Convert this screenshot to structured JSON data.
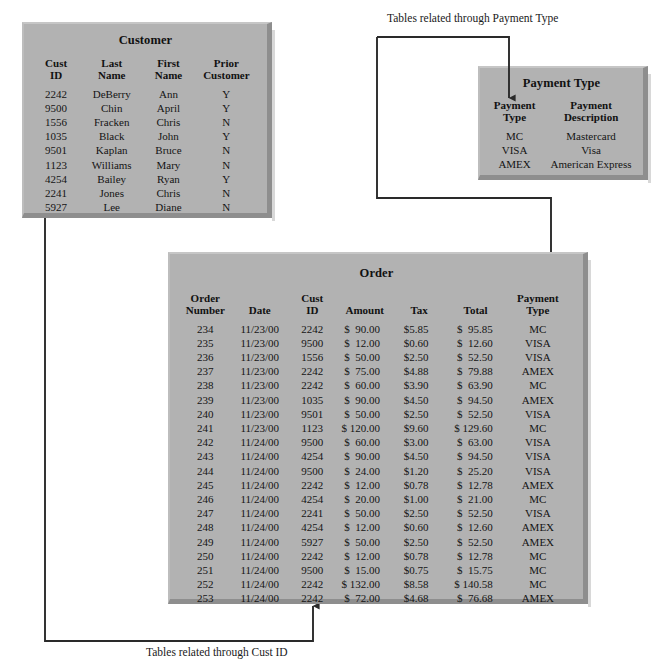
{
  "diagram": {
    "panel_color": "#b2b2b2",
    "line_color": "#2a2a2a"
  },
  "annotations": {
    "payment_link": "Tables related through Payment Type",
    "cust_link": "Tables related through Cust ID"
  },
  "customer": {
    "title": "Customer",
    "columns": [
      "Cust\nID",
      "Last\nName",
      "First\nName",
      "Prior\nCustomer"
    ],
    "rows": [
      [
        "2242",
        "DeBerry",
        "Ann",
        "Y"
      ],
      [
        "9500",
        "Chin",
        "April",
        "Y"
      ],
      [
        "1556",
        "Fracken",
        "Chris",
        "N"
      ],
      [
        "1035",
        "Black",
        "John",
        "Y"
      ],
      [
        "9501",
        "Kaplan",
        "Bruce",
        "N"
      ],
      [
        "1123",
        "Williams",
        "Mary",
        "N"
      ],
      [
        "4254",
        "Bailey",
        "Ryan",
        "Y"
      ],
      [
        "2241",
        "Jones",
        "Chris",
        "N"
      ],
      [
        "5927",
        "Lee",
        "Diane",
        "N"
      ]
    ]
  },
  "payment_type": {
    "title": "Payment Type",
    "columns": [
      "Payment\nType",
      "Payment\nDescription"
    ],
    "rows": [
      [
        "MC",
        "Mastercard"
      ],
      [
        "VISA",
        "Visa"
      ],
      [
        "AMEX",
        "American Express"
      ]
    ]
  },
  "order": {
    "title": "Order",
    "columns": [
      "Order\nNumber",
      "Date",
      "Cust\nID",
      "Amount",
      "Tax",
      "Total",
      "Payment\nType"
    ],
    "rows": [
      [
        "234",
        "11/23/00",
        "2242",
        "$  90.00",
        "$5.85",
        "$  95.85",
        "MC"
      ],
      [
        "235",
        "11/23/00",
        "9500",
        "$  12.00",
        "$0.60",
        "$  12.60",
        "VISA"
      ],
      [
        "236",
        "11/23/00",
        "1556",
        "$  50.00",
        "$2.50",
        "$  52.50",
        "VISA"
      ],
      [
        "237",
        "11/23/00",
        "2242",
        "$  75.00",
        "$4.88",
        "$  79.88",
        "AMEX"
      ],
      [
        "238",
        "11/23/00",
        "2242",
        "$  60.00",
        "$3.90",
        "$  63.90",
        "MC"
      ],
      [
        "239",
        "11/23/00",
        "1035",
        "$  90.00",
        "$4.50",
        "$  94.50",
        "AMEX"
      ],
      [
        "240",
        "11/23/00",
        "9501",
        "$  50.00",
        "$2.50",
        "$  52.50",
        "VISA"
      ],
      [
        "241",
        "11/23/00",
        "1123",
        "$ 120.00",
        "$9.60",
        "$ 129.60",
        "MC"
      ],
      [
        "242",
        "11/24/00",
        "9500",
        "$  60.00",
        "$3.00",
        "$  63.00",
        "VISA"
      ],
      [
        "243",
        "11/24/00",
        "4254",
        "$  90.00",
        "$4.50",
        "$  94.50",
        "VISA"
      ],
      [
        "244",
        "11/24/00",
        "9500",
        "$  24.00",
        "$1.20",
        "$  25.20",
        "VISA"
      ],
      [
        "245",
        "11/24/00",
        "2242",
        "$  12.00",
        "$0.78",
        "$  12.78",
        "AMEX"
      ],
      [
        "246",
        "11/24/00",
        "4254",
        "$  20.00",
        "$1.00",
        "$  21.00",
        "MC"
      ],
      [
        "247",
        "11/24/00",
        "2241",
        "$  50.00",
        "$2.50",
        "$  52.50",
        "VISA"
      ],
      [
        "248",
        "11/24/00",
        "4254",
        "$  12.00",
        "$0.60",
        "$  12.60",
        "AMEX"
      ],
      [
        "249",
        "11/24/00",
        "5927",
        "$  50.00",
        "$2.50",
        "$  52.50",
        "AMEX"
      ],
      [
        "250",
        "11/24/00",
        "2242",
        "$  12.00",
        "$0.78",
        "$  12.78",
        "MC"
      ],
      [
        "251",
        "11/24/00",
        "9500",
        "$  15.00",
        "$0.75",
        "$  15.75",
        "MC"
      ],
      [
        "252",
        "11/24/00",
        "2242",
        "$ 132.00",
        "$8.58",
        "$ 140.58",
        "MC"
      ],
      [
        "253",
        "11/24/00",
        "2242",
        "$  72.00",
        "$4.68",
        "$  76.68",
        "AMEX"
      ]
    ]
  }
}
